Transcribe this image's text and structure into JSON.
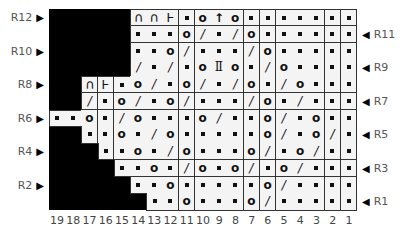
{
  "chart": {
    "type": "knitting-chart",
    "columns": 19,
    "rows": 12,
    "column_numbers": [
      "19",
      "18",
      "17",
      "16",
      "15",
      "14",
      "13",
      "12",
      "11",
      "10",
      "9",
      "8",
      "7",
      "6",
      "5",
      "4",
      "3",
      "2",
      "1"
    ],
    "symbols": {
      "dot": "knit (purl dot)",
      "o": "yarn over",
      "slash": "k2tog",
      "cap": "cast off / bind off arc",
      "t": "t-stitch",
      "up": "centered double decrease",
      "ii": "ii stitch"
    },
    "row_list": [
      {
        "row": 12,
        "label": "R12",
        "side": "left",
        "start_col": 14,
        "cells": [
          "cap",
          "cap",
          "t",
          "dot",
          "o",
          "up",
          "o",
          "dot",
          "dot",
          "dot",
          "dot",
          "dot",
          "dot",
          "dot"
        ]
      },
      {
        "row": 11,
        "label": "R11",
        "side": "right",
        "start_col": 14,
        "cells": [
          "dot",
          "dot",
          "dot",
          "o",
          "slash",
          "dot",
          "slash",
          "o",
          "dot",
          "dot",
          "dot",
          "dot",
          "dot",
          "dot"
        ]
      },
      {
        "row": 10,
        "label": "R10",
        "side": "left",
        "start_col": 14,
        "cells": [
          "dot",
          "dot",
          "o",
          "slash",
          "dot",
          "dot",
          "dot",
          "slash",
          "o",
          "dot",
          "dot",
          "dot",
          "dot",
          "dot"
        ]
      },
      {
        "row": 9,
        "label": "R9",
        "side": "right",
        "start_col": 14,
        "cells": [
          "slash",
          "dot",
          "slash",
          "dot",
          "o",
          "ii",
          "o",
          "dot",
          "slash",
          "o",
          "dot",
          "dot",
          "dot",
          "dot"
        ]
      },
      {
        "row": 8,
        "label": "R8",
        "side": "left",
        "start_col": 17,
        "cells": [
          "cap",
          "t",
          "dot",
          "o",
          "slash",
          "dot",
          "o",
          "slash",
          "dot",
          "slash",
          "o",
          "dot",
          "slash",
          "o",
          "dot",
          "dot",
          "dot"
        ]
      },
      {
        "row": 7,
        "label": "R7",
        "side": "right",
        "start_col": 17,
        "cells": [
          "slash",
          "dot",
          "o",
          "slash",
          "dot",
          "o",
          "slash",
          "dot",
          "dot",
          "dot",
          "slash",
          "o",
          "dot",
          "slash",
          "dot",
          "dot",
          "dot"
        ]
      },
      {
        "row": 6,
        "label": "R6",
        "side": "left",
        "start_col": 19,
        "cells": [
          "dot",
          "dot",
          "o",
          "dot",
          "slash",
          "o",
          "dot",
          "dot",
          "dot",
          "o",
          "slash",
          "dot",
          "dot",
          "o",
          "slash",
          "dot",
          "o",
          "dot",
          "dot"
        ]
      },
      {
        "row": 5,
        "label": "R5",
        "side": "right",
        "start_col": 17,
        "cells": [
          "dot",
          "dot",
          "o",
          "dot",
          "slash",
          "o",
          "dot",
          "dot",
          "dot",
          "dot",
          "dot",
          "o",
          "slash",
          "dot",
          "o",
          "slash",
          "dot"
        ]
      },
      {
        "row": 4,
        "label": "R4",
        "side": "left",
        "start_col": 16,
        "cells": [
          "dot",
          "dot",
          "o",
          "dot",
          "slash",
          "o",
          "dot",
          "dot",
          "dot",
          "o",
          "slash",
          "dot",
          "o",
          "slash",
          "dot",
          "dot"
        ]
      },
      {
        "row": 3,
        "label": "R3",
        "side": "right",
        "start_col": 15,
        "cells": [
          "dot",
          "dot",
          "o",
          "dot",
          "slash",
          "o",
          "dot",
          "o",
          "slash",
          "dot",
          "o",
          "slash",
          "dot",
          "dot",
          "dot"
        ]
      },
      {
        "row": 2,
        "label": "R2",
        "side": "left",
        "start_col": 14,
        "cells": [
          "dot",
          "dot",
          "o",
          "dot",
          "dot",
          "dot",
          "dot",
          "dot",
          "o",
          "slash",
          "dot",
          "dot",
          "dot",
          "dot"
        ]
      },
      {
        "row": 1,
        "label": "R1",
        "side": "right",
        "start_col": 13,
        "cells": [
          "dot",
          "dot",
          "o",
          "dot",
          "dot",
          "dot",
          "o",
          "slash",
          "dot",
          "dot",
          "dot",
          "dot",
          "dot"
        ]
      }
    ],
    "glyphs": {
      "o": "o",
      "slash": "/",
      "cap": "∩",
      "t": "Ⱶ",
      "up": "↑",
      "ii": "Ⅱ",
      "dot": ""
    },
    "arrow_left": "▶",
    "arrow_right": "◀"
  },
  "colors": {
    "background": "#ffffff",
    "no_stitch": "#000000",
    "cell": "#f4f4f4",
    "grid_line": "#333333",
    "label_text": "#555555"
  }
}
